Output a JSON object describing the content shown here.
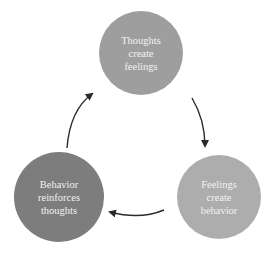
{
  "diagram": {
    "title": "",
    "nodes": [
      {
        "id": "thoughts",
        "lines": [
          "Thoughts",
          "create",
          "feelings"
        ],
        "color": "#9e9e9e",
        "cx": 141,
        "cy": 53,
        "r": 42
      },
      {
        "id": "feelings",
        "lines": [
          "Feelings",
          "create",
          "behavior"
        ],
        "color": "#adadad",
        "cx": 219,
        "cy": 197,
        "r": 42
      },
      {
        "id": "behavior",
        "lines": [
          "Behavior",
          "reinforces",
          "thoughts"
        ],
        "color": "#7d7d7d",
        "cx": 59,
        "cy": 197,
        "r": 45
      }
    ],
    "edges": [
      {
        "from": "thoughts",
        "to": "feelings",
        "label": ""
      },
      {
        "from": "feelings",
        "to": "behavior",
        "label": ""
      },
      {
        "from": "behavior",
        "to": "thoughts",
        "label": ""
      }
    ],
    "arrow_color": "#2a2a2a"
  }
}
